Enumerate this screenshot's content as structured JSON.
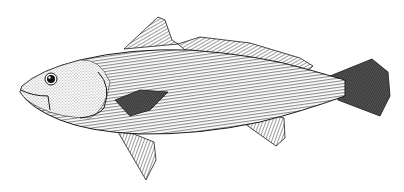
{
  "image": {
    "subject": "fish illustration",
    "style": "black and white engraving / stipple",
    "background": "#ffffff",
    "ink": "#1a1a1a",
    "width": 404,
    "height": 192
  },
  "figure": {
    "parts": [
      "body",
      "head",
      "eye",
      "mouth",
      "gill-cover",
      "dorsal-fin-spiny",
      "dorsal-fin-soft",
      "pectoral-fin",
      "pelvic-fin",
      "anal-fin",
      "caudal-fin"
    ]
  }
}
